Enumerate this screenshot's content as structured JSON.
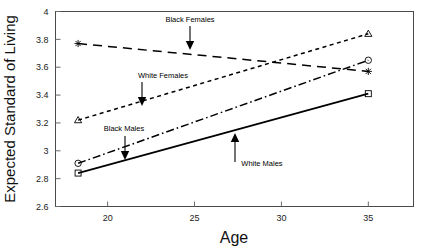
{
  "chart_data": {
    "type": "line",
    "title": "",
    "xlabel": "Age",
    "ylabel": "Expected Standard of Living",
    "xlim": [
      17.0,
      37.6
    ],
    "ylim": [
      2.6,
      4.0
    ],
    "xticks": [
      20,
      25,
      30,
      35
    ],
    "xtick_labels": [
      "20",
      "25",
      "30",
      "35"
    ],
    "yticks": [
      2.6,
      2.8,
      3.0,
      3.2,
      3.4,
      3.6,
      3.8,
      4.0
    ],
    "ytick_labels": [
      "2.6",
      "2.8",
      "3",
      "3.2",
      "3.4",
      "3.6",
      "3.8",
      "4"
    ],
    "grid": false,
    "legend": "annotations",
    "x": [
      18.3,
      35.0
    ],
    "series": [
      {
        "name": "Black Females",
        "values": [
          3.77,
          3.57
        ],
        "linestyle": "long-dash",
        "marker": "plus",
        "color": "#000000"
      },
      {
        "name": "White Females",
        "values": [
          3.22,
          3.84
        ],
        "linestyle": "short-dash",
        "marker": "triangle",
        "color": "#000000"
      },
      {
        "name": "Black Males",
        "values": [
          2.91,
          3.65
        ],
        "linestyle": "dash-dot",
        "marker": "circle",
        "color": "#000000"
      },
      {
        "name": "White Males",
        "values": [
          2.84,
          3.41
        ],
        "linestyle": "solid",
        "marker": "square",
        "color": "#000000"
      }
    ],
    "annotations": [
      {
        "label": "Black Females",
        "text_x": 190,
        "text_y": 22,
        "arrow_from_x": 190,
        "arrow_from_y": 26,
        "arrow_to_x": 190,
        "arrow_to_y": 50
      },
      {
        "label": "White Females",
        "text_x": 163,
        "text_y": 78,
        "arrow_from_x": 142,
        "arrow_from_y": 82,
        "arrow_to_x": 142,
        "arrow_to_y": 106
      },
      {
        "label": "Black Males",
        "text_x": 124,
        "text_y": 131,
        "arrow_from_x": 125,
        "arrow_from_y": 136,
        "arrow_to_x": 125,
        "arrow_to_y": 160
      },
      {
        "label": "White Males",
        "text_x": 262,
        "text_y": 166,
        "arrow_from_x": 235,
        "arrow_from_y": 162,
        "arrow_to_x": 235,
        "arrow_to_y": 133
      }
    ]
  }
}
